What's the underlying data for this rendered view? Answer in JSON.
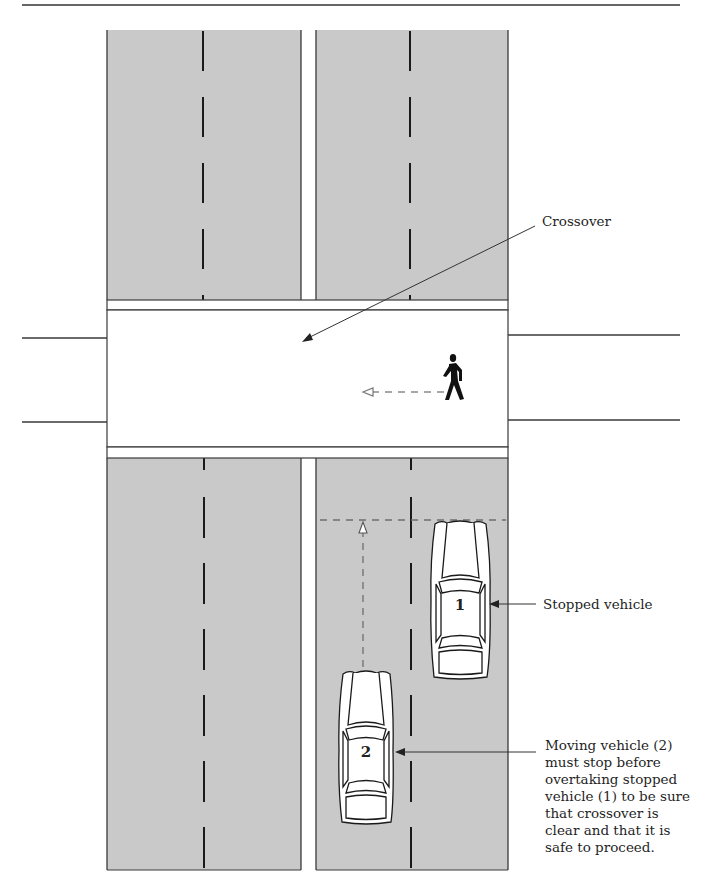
{
  "diagram": {
    "title_rule": true,
    "colors": {
      "road": "#c9c9c9",
      "road_edge": "#3a3a3a",
      "lane_dash": "#1a1a1a",
      "crossover_fill": "#ffffff",
      "path_dash": "#6f6f6f",
      "car_outline": "#1a1a1a",
      "car_fill": "#ffffff",
      "text": "#1f1f1f"
    },
    "labels": {
      "crossover": "Crossover",
      "stopped_vehicle": "Stopped vehicle",
      "moving_vehicle_caption": [
        "Moving vehicle (2)",
        "must stop before",
        "overtaking stopped",
        "vehicle (1) to be sure",
        "that crossover is",
        "clear and that it is",
        "safe to proceed."
      ]
    },
    "vehicles": [
      {
        "id": "1",
        "number": "1",
        "state": "stopped"
      },
      {
        "id": "2",
        "number": "2",
        "state": "moving"
      }
    ],
    "icons": {
      "pedestrian": "pedestrian-walking-icon",
      "pedestrian_direction": "arrow-left-dashed",
      "vehicle_path": "arrow-up-dashed"
    }
  }
}
